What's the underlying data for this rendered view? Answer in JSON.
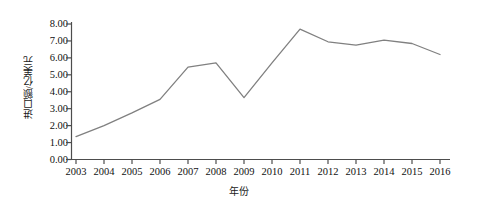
{
  "chart_data": {
    "type": "line",
    "title": "",
    "xlabel": "年份",
    "ylabel": "进口额/亿美元",
    "categories": [
      "2003",
      "2004",
      "2005",
      "2006",
      "2007",
      "2008",
      "2009",
      "2010",
      "2011",
      "2012",
      "2013",
      "2014",
      "2015",
      "2016"
    ],
    "values": [
      1.35,
      2.0,
      2.75,
      3.55,
      5.45,
      5.7,
      3.65,
      5.7,
      7.7,
      6.95,
      6.75,
      7.05,
      6.85,
      6.2
    ],
    "series": [
      {
        "name": "进口额",
        "values": [
          1.35,
          2.0,
          2.75,
          3.55,
          5.45,
          5.7,
          3.65,
          5.7,
          7.7,
          6.95,
          6.75,
          7.05,
          6.85,
          6.2
        ]
      }
    ],
    "ylim": [
      0,
      8
    ],
    "ytick_step": 1,
    "ytick_labels": [
      "0.00",
      "1.00",
      "2.00",
      "3.00",
      "4.00",
      "5.00",
      "6.00",
      "7.00",
      "8.00"
    ],
    "ytick_values": [
      0,
      1,
      2,
      3,
      4,
      5,
      6,
      7,
      8
    ],
    "grid": false,
    "legend": "none",
    "line_color": "#808080",
    "axis_color": "#4d4d4d"
  }
}
